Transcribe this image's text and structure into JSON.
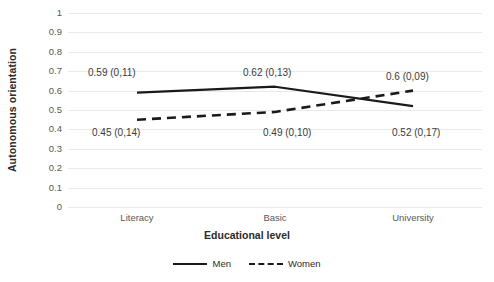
{
  "chart_data": {
    "type": "line",
    "title": "",
    "xlabel": "Educational level",
    "ylabel": "Autonomous orientation",
    "categories": [
      "Literacy",
      "Basic",
      "University"
    ],
    "ylim": [
      0,
      1
    ],
    "yticks": [
      "0",
      "0.1",
      "0.2",
      "0.3",
      "0.4",
      "0.5",
      "0.6",
      "0.7",
      "0.8",
      "0.9",
      "1"
    ],
    "grid": true,
    "legend_position": "bottom",
    "series": [
      {
        "name": "Men",
        "style": "solid",
        "color": "#1a1a1a",
        "values": [
          0.59,
          0.62,
          0.52
        ],
        "sd": [
          "0,11",
          "0,13",
          "0,17"
        ],
        "labels": [
          "0.59 (0,11)",
          "0.62 (0,13)",
          "0.52 (0,17)"
        ]
      },
      {
        "name": "Women",
        "style": "dashed",
        "color": "#1a1a1a",
        "values": [
          0.45,
          0.49,
          0.6
        ],
        "sd": [
          "0,14",
          "0,10",
          "0,09"
        ],
        "labels": [
          "0.45 (0,14)",
          "0.49 (0,10)",
          "0.6 (0,09)"
        ]
      }
    ],
    "annotations": [
      {
        "text": "0.59 (0,11)",
        "x": 88,
        "y": 68
      },
      {
        "text": "0.62 (0,13)",
        "x": 243,
        "y": 68
      },
      {
        "text": "0.6 (0,09)",
        "x": 386,
        "y": 72
      },
      {
        "text": "0.45 (0,14)",
        "x": 92,
        "y": 128
      },
      {
        "text": "0.49 (0,10)",
        "x": 263,
        "y": 128
      },
      {
        "text": "0.52 (0,17)",
        "x": 392,
        "y": 128
      }
    ]
  },
  "legend": {
    "entries": [
      {
        "label": "Men",
        "style": "solid"
      },
      {
        "label": "Women",
        "style": "dashed"
      }
    ]
  },
  "colors": {
    "line": "#1a1a1a",
    "grid": "#e9e9e9",
    "text": "#595959",
    "title_text": "#2b2b2b",
    "background": "#ffffff"
  }
}
